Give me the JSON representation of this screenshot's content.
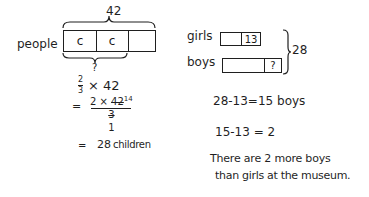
{
  "left_model": {
    "total_label": "42",
    "row_label": "people",
    "cells": [
      "c",
      "c",
      ""
    ],
    "unknown_label": "?"
  },
  "left_work": {
    "step1": {
      "frac_num": "2",
      "frac_den": "3",
      "rest": "× 42"
    },
    "step2": {
      "equals": "=",
      "num_a": "2 × ",
      "num_b": "42",
      "num_sup": "14",
      "den": "3",
      "den_below": "1"
    },
    "step3": {
      "equals": "=",
      "result": "28",
      "unit": "children"
    }
  },
  "right_model": {
    "girls_label": "girls",
    "girls_value": "13",
    "boys_label": "boys",
    "boys_unknown": "?",
    "total_label": "28"
  },
  "right_work": {
    "line1": "28-13=15 boys",
    "line2": "15-13 = 2",
    "answer_line1": "There are 2 more boys",
    "answer_line2": "than girls at the museum."
  },
  "colors": {
    "ink": "#1f1f1f",
    "background": "#ffffff"
  }
}
